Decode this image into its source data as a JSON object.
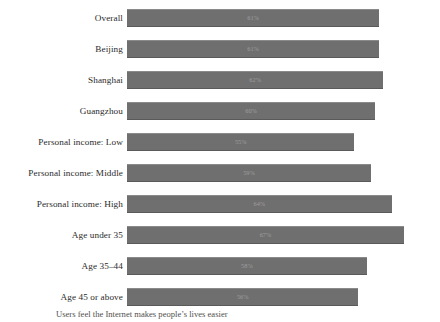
{
  "chart_data": {
    "type": "bar",
    "orientation": "horizontal",
    "title": "",
    "subtitle": "",
    "xlabel": "",
    "ylabel": "",
    "xlim": [
      0,
      75
    ],
    "grid": false,
    "legend": null,
    "bar_color": "#6f6f6f",
    "value_label_color": "#9d9d9d",
    "categories": [
      "Overall",
      "Beijing",
      "Shanghai",
      "Guangzhou",
      "Personal income: Low",
      "Personal income: Middle",
      "Personal income: High",
      "Age under 35",
      "Age 35–44",
      "Age 45 or above"
    ],
    "values": [
      61,
      61,
      62,
      60,
      55,
      59,
      64,
      67,
      58,
      56
    ],
    "value_labels": [
      "61%",
      "61%",
      "62%",
      "60%",
      "55%",
      "59%",
      "64%",
      "67%",
      "58%",
      "56%"
    ]
  },
  "caption": {
    "text": "Users feel the Internet makes people’s lives easier"
  }
}
